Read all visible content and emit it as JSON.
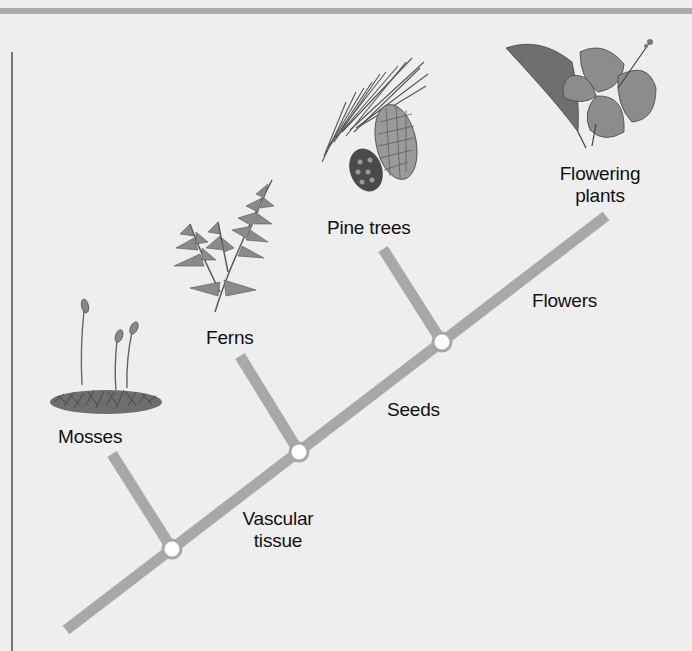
{
  "diagram": {
    "type": "cladogram",
    "colors": {
      "background": "#eeeeee",
      "line": "#a8a8a8",
      "node_fill": "#ffffff",
      "text": "#111111",
      "top_rule": "#a9a9a9"
    },
    "taxa": [
      {
        "id": "mosses",
        "label": "Mosses",
        "illustration": "moss-illustration"
      },
      {
        "id": "ferns",
        "label": "Ferns",
        "illustration": "fern-illustration"
      },
      {
        "id": "pines",
        "label": "Pine trees",
        "illustration": "pine-cone-illustration"
      },
      {
        "id": "flowering",
        "label_line1": "Flowering",
        "label_line2": "plants",
        "illustration": "hibiscus-illustration"
      }
    ],
    "traits": [
      {
        "id": "vascular",
        "label_line1": "Vascular",
        "label_line2": "tissue"
      },
      {
        "id": "seeds",
        "label": "Seeds"
      },
      {
        "id": "flowers",
        "label": "Flowers"
      }
    ],
    "geometry": {
      "trunk": {
        "x1": 66,
        "y1": 630,
        "x2": 606,
        "y2": 216
      },
      "nodes": [
        {
          "cx": 172,
          "cy": 549
        },
        {
          "cx": 299,
          "cy": 452
        },
        {
          "cx": 442,
          "cy": 342
        }
      ],
      "branches": [
        {
          "x1": 112,
          "y1": 454,
          "x2": 172,
          "y2": 549
        },
        {
          "x1": 240,
          "y1": 356,
          "x2": 299,
          "y2": 452
        },
        {
          "x1": 383,
          "y1": 249,
          "x2": 442,
          "y2": 342
        }
      ]
    }
  }
}
